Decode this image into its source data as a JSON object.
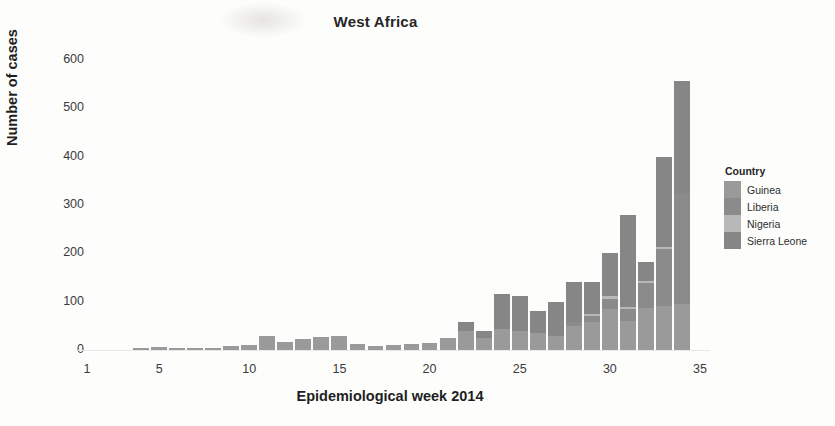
{
  "chart_data": {
    "type": "bar",
    "stacked": true,
    "title": "West Africa",
    "xlabel": "Epidemiological week 2014",
    "ylabel": "Number of cases",
    "xlim": [
      0.3,
      35.2
    ],
    "ylim": [
      0,
      640
    ],
    "yticks": [
      0,
      100,
      200,
      300,
      400,
      500,
      600
    ],
    "xticks": [
      1,
      5,
      10,
      15,
      20,
      25,
      30,
      35
    ],
    "grid": false,
    "legend": {
      "title": "Country",
      "position": "right",
      "entries": [
        {
          "name": "Guinea",
          "color": "#9a9a9a"
        },
        {
          "name": "Liberia",
          "color": "#8b8b8b"
        },
        {
          "name": "Nigeria",
          "color": "#b8b8b8"
        },
        {
          "name": "Sierra Leone",
          "color": "#868686"
        }
      ]
    },
    "categories": [
      1,
      2,
      3,
      4,
      5,
      6,
      7,
      8,
      9,
      10,
      11,
      12,
      13,
      14,
      15,
      16,
      17,
      18,
      19,
      20,
      21,
      22,
      23,
      24,
      25,
      26,
      27,
      28,
      29,
      30,
      31,
      32,
      33,
      34
    ],
    "series": [
      {
        "name": "Guinea",
        "color": "#9a9a9a",
        "values": [
          0,
          0,
          0,
          4,
          6,
          5,
          4,
          5,
          8,
          10,
          28,
          17,
          22,
          27,
          30,
          12,
          9,
          10,
          12,
          14,
          24,
          40,
          24,
          44,
          40,
          36,
          30,
          50,
          58,
          84,
          60,
          86,
          92,
          95
        ]
      },
      {
        "name": "Liberia",
        "color": "#8b8b8b",
        "values": [
          0,
          0,
          0,
          0,
          0,
          0,
          0,
          0,
          0,
          0,
          0,
          0,
          0,
          0,
          0,
          0,
          0,
          0,
          0,
          0,
          0,
          0,
          0,
          0,
          0,
          0,
          0,
          8,
          12,
          22,
          25,
          52,
          118,
          228
        ]
      },
      {
        "name": "Nigeria",
        "color": "#b8b8b8",
        "values": [
          0,
          0,
          0,
          0,
          0,
          0,
          0,
          0,
          0,
          0,
          0,
          0,
          0,
          0,
          0,
          0,
          0,
          0,
          0,
          0,
          0,
          0,
          0,
          0,
          0,
          0,
          0,
          0,
          4,
          5,
          4,
          4,
          4,
          0
        ]
      },
      {
        "name": "Sierra Leone",
        "color": "#868686",
        "values": [
          0,
          0,
          0,
          0,
          0,
          0,
          0,
          0,
          0,
          0,
          0,
          0,
          0,
          0,
          0,
          0,
          0,
          0,
          0,
          0,
          0,
          18,
          16,
          72,
          72,
          44,
          70,
          82,
          66,
          90,
          190,
          40,
          185,
          234
        ]
      }
    ],
    "totals": [
      0,
      0,
      0,
      4,
      6,
      5,
      4,
      5,
      8,
      10,
      28,
      17,
      22,
      27,
      30,
      12,
      9,
      10,
      12,
      14,
      24,
      58,
      40,
      116,
      112,
      80,
      100,
      140,
      140,
      201,
      279,
      182,
      399,
      557
    ]
  }
}
